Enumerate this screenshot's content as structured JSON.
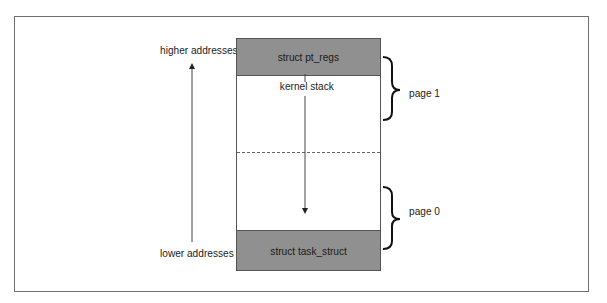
{
  "diagram": {
    "title": "",
    "address_axis": {
      "top_label": "higher addresses",
      "bottom_label": "lower addresses",
      "direction": "up"
    },
    "stack_block": {
      "regions": [
        {
          "label": "struct pt_regs",
          "position": "top",
          "fill": "#909090"
        },
        {
          "label": "kernel stack",
          "position": "middle",
          "fill": "#ffffff",
          "growth": "down"
        },
        {
          "label": "struct task_struct",
          "position": "bottom",
          "fill": "#909090"
        }
      ],
      "page_divider": "dashed"
    },
    "pages": [
      {
        "label": "page 1",
        "brace": "right",
        "spans": "upper half"
      },
      {
        "label": "page 0",
        "brace": "right",
        "spans": "lower half"
      }
    ]
  }
}
